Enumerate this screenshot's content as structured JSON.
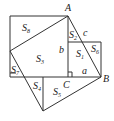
{
  "diagram": {
    "points": {
      "A": "A",
      "B": "B",
      "C": "C"
    },
    "sides": {
      "a": "a",
      "b": "b",
      "c": "c"
    },
    "regions": [
      {
        "base": "S",
        "sub": "8"
      },
      {
        "base": "S",
        "sub": "3"
      },
      {
        "base": "S",
        "sub": "2"
      },
      {
        "base": "S",
        "sub": "1"
      },
      {
        "base": "S",
        "sub": "6"
      },
      {
        "base": "S",
        "sub": "7"
      },
      {
        "base": "S",
        "sub": "4"
      },
      {
        "base": "S",
        "sub": "5"
      }
    ]
  }
}
